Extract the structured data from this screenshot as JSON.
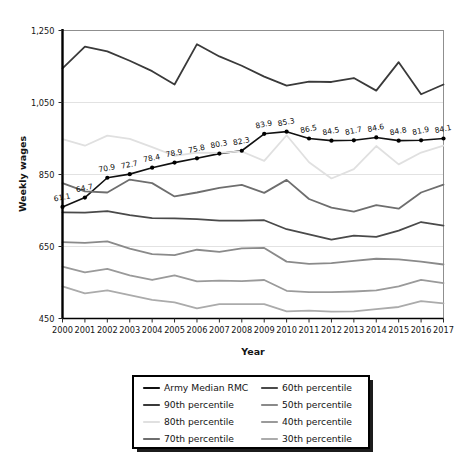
{
  "chart_data": {
    "type": "line",
    "title": "",
    "xlabel": "Year",
    "ylabel": "Weekly wages",
    "x": [
      2000,
      2001,
      2002,
      2003,
      2004,
      2005,
      2006,
      2007,
      2008,
      2009,
      2010,
      2011,
      2012,
      2013,
      2014,
      2015,
      2016,
      2017
    ],
    "categories": [
      "2000",
      "2001",
      "2002",
      "2003",
      "2004",
      "2005",
      "2006",
      "2007",
      "2008",
      "2009",
      "2010",
      "2011",
      "2012",
      "2013",
      "2014",
      "2015",
      "2016",
      "2017"
    ],
    "ylim": [
      450,
      1250
    ],
    "yticks": [
      450,
      650,
      850,
      1050,
      1250
    ],
    "ytick_labels": [
      "450",
      "650",
      "850",
      "1,050",
      "1,250"
    ],
    "xlim": [
      2000,
      2017
    ],
    "grid": "horizontal",
    "legend_position": "below-plot",
    "series": [
      {
        "name": "Army Median RMC",
        "color": "#111111",
        "width": 1.6,
        "markers": true,
        "values": [
          760,
          786,
          841,
          851,
          869,
          883,
          895,
          908,
          916,
          963,
          969,
          950,
          944,
          945,
          953,
          944,
          945,
          950
        ],
        "point_labels": [
          "61.1",
          "64.7",
          "70.9",
          "72.7",
          "78.4",
          "78.9",
          "75.8",
          "80.3",
          "82.3",
          "83.9",
          "85.3",
          "86.5",
          "84.5",
          "81.7",
          "84.6",
          "84.8",
          "81.9",
          "84.1"
        ]
      },
      {
        "name": "90th percentile",
        "color": "#3a3a3a",
        "width": 1.8,
        "markers": false,
        "values": [
          1145,
          1205,
          1192,
          1166,
          1137,
          1100,
          1212,
          1178,
          1152,
          1122,
          1097,
          1108,
          1107,
          1118,
          1083,
          1162,
          1073,
          1100
        ]
      },
      {
        "name": "80th percentile",
        "color": "#e0e0e0",
        "width": 1.8,
        "markers": false,
        "values": [
          948,
          930,
          958,
          949,
          926,
          902,
          911,
          910,
          914,
          888,
          959,
          884,
          839,
          865,
          929,
          878,
          911,
          930
        ]
      },
      {
        "name": "70th percentile",
        "color": "#6e6e6e",
        "width": 1.8,
        "markers": false,
        "values": [
          826,
          803,
          800,
          836,
          826,
          789,
          800,
          813,
          821,
          799,
          835,
          782,
          758,
          747,
          765,
          755,
          800,
          822
        ]
      },
      {
        "name": "60th percentile",
        "color": "#4a4a4a",
        "width": 1.8,
        "markers": false,
        "values": [
          745,
          744,
          748,
          737,
          729,
          728,
          726,
          722,
          722,
          723,
          698,
          684,
          669,
          680,
          677,
          694,
          718,
          708
        ]
      },
      {
        "name": "50th percentile",
        "color": "#8a8a8a",
        "width": 1.8,
        "markers": false,
        "values": [
          662,
          660,
          664,
          644,
          629,
          626,
          641,
          635,
          645,
          646,
          608,
          602,
          604,
          610,
          616,
          614,
          608,
          600
        ]
      },
      {
        "name": "40th percentile",
        "color": "#9a9a9a",
        "width": 1.8,
        "markers": false,
        "values": [
          594,
          578,
          588,
          570,
          557,
          570,
          553,
          555,
          554,
          557,
          527,
          523,
          523,
          525,
          528,
          539,
          557,
          548
        ]
      },
      {
        "name": "30th percentile",
        "color": "#ababab",
        "width": 1.8,
        "markers": false,
        "values": [
          539,
          520,
          528,
          515,
          502,
          495,
          478,
          490,
          490,
          490,
          470,
          472,
          469,
          470,
          476,
          482,
          498,
          492
        ]
      }
    ]
  },
  "legend": {
    "entries": [
      {
        "label": "Army Median RMC",
        "color": "#111111"
      },
      {
        "label": "60th percentile",
        "color": "#4a4a4a"
      },
      {
        "label": "90th percentile",
        "color": "#3a3a3a"
      },
      {
        "label": "50th percentile",
        "color": "#8a8a8a"
      },
      {
        "label": "80th percentile",
        "color": "#e0e0e0"
      },
      {
        "label": "40th percentile",
        "color": "#9a9a9a"
      },
      {
        "label": "70th percentile",
        "color": "#6e6e6e"
      },
      {
        "label": "30th percentile",
        "color": "#ababab"
      }
    ]
  }
}
